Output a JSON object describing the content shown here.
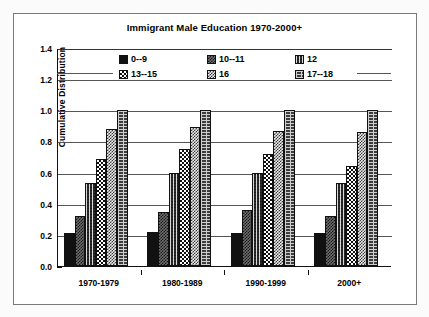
{
  "chart_data": {
    "type": "bar",
    "title": "Immigrant Male Education 1970-2000+",
    "xlabel": "",
    "ylabel": "Cumulative Distribution",
    "ylim": [
      0.0,
      1.4
    ],
    "yticks": [
      "0.0",
      "0.2",
      "0.4",
      "0.6",
      "0.8",
      "1.0",
      "1.2",
      "1.4"
    ],
    "ytick_values": [
      0.0,
      0.2,
      0.4,
      0.6,
      0.8,
      1.0,
      1.2,
      1.4
    ],
    "grid": "horizontal",
    "legend_position": "top-center",
    "categories": [
      "1970-1979",
      "1980-1989",
      "1990-1999",
      "2000+"
    ],
    "series": [
      {
        "name": "0--9",
        "pattern": "solid-black",
        "values": [
          0.21,
          0.22,
          0.21,
          0.21
        ]
      },
      {
        "name": "10--11",
        "pattern": "medium-dither",
        "values": [
          0.32,
          0.35,
          0.36,
          0.32
        ]
      },
      {
        "name": "12",
        "pattern": "dark-checker",
        "values": [
          0.53,
          0.6,
          0.6,
          0.53
        ]
      },
      {
        "name": "13--15",
        "pattern": "white-checker",
        "values": [
          0.69,
          0.75,
          0.72,
          0.64
        ]
      },
      {
        "name": "16",
        "pattern": "light-dither",
        "values": [
          0.88,
          0.89,
          0.87,
          0.86
        ]
      },
      {
        "name": "17--18",
        "pattern": "brick",
        "values": [
          1.0,
          1.0,
          1.0,
          1.0
        ]
      }
    ]
  }
}
